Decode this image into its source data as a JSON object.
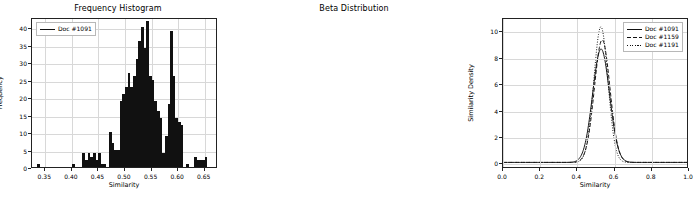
{
  "figure": {
    "width": 472,
    "height": 199,
    "background": "#ffffff",
    "ink_color": "#111111",
    "grid_color": "#d8d8d8"
  },
  "panels": [
    {
      "id": "frequency-histogram",
      "title": "Frequency Histogram",
      "xlabel": "Similarity",
      "ylabel": "Frequency",
      "legend": [
        {
          "label": "Doc #1091",
          "style": "solid"
        }
      ]
    },
    {
      "id": "beta-distribution",
      "title": "Beta Distribution",
      "xlabel": "Similarity",
      "ylabel": "Similarity Density",
      "legend": [
        {
          "label": "Doc #1091",
          "style": "solid"
        },
        {
          "label": "Doc #1159",
          "style": "dashed"
        },
        {
          "label": "Doc #1191",
          "style": "dotted"
        }
      ]
    }
  ],
  "chart_data": [
    {
      "type": "bar",
      "title": "Frequency Histogram",
      "xlabel": "Similarity",
      "ylabel": "Frequency",
      "legend": [
        "Doc #1091"
      ],
      "legend_position": "upper left",
      "grid": true,
      "xlim": [
        0.325,
        0.675
      ],
      "ylim": [
        0,
        43
      ],
      "xticks": [
        0.35,
        0.4,
        0.45,
        0.5,
        0.55,
        0.6,
        0.65
      ],
      "xticklabels": [
        "0.35",
        "0.40",
        "0.45",
        "0.50",
        "0.55",
        "0.60",
        "0.65"
      ],
      "yticks": [
        0,
        5,
        10,
        15,
        20,
        25,
        30,
        35,
        40
      ],
      "yticklabels": [
        "0",
        "5",
        "10",
        "15",
        "20",
        "25",
        "30",
        "35",
        "40"
      ],
      "bin_width": 0.005,
      "bin_left_edges": [
        0.335,
        0.34,
        0.345,
        0.35,
        0.355,
        0.36,
        0.365,
        0.37,
        0.375,
        0.38,
        0.385,
        0.39,
        0.395,
        0.4,
        0.405,
        0.41,
        0.415,
        0.42,
        0.425,
        0.43,
        0.435,
        0.44,
        0.445,
        0.45,
        0.455,
        0.46,
        0.465,
        0.47,
        0.475,
        0.48,
        0.485,
        0.49,
        0.495,
        0.5,
        0.505,
        0.51,
        0.515,
        0.52,
        0.525,
        0.53,
        0.535,
        0.54,
        0.545,
        0.55,
        0.555,
        0.56,
        0.565,
        0.57,
        0.575,
        0.58,
        0.585,
        0.59,
        0.595,
        0.6,
        0.605,
        0.61,
        0.615,
        0.62,
        0.625,
        0.63,
        0.635,
        0.64,
        0.645,
        0.65,
        0.655,
        0.66,
        0.665
      ],
      "values": [
        1,
        0,
        0,
        0,
        0,
        0,
        0,
        0,
        0,
        0,
        0,
        0,
        0,
        1,
        0,
        0,
        0,
        4,
        2,
        4,
        3,
        4,
        2,
        4,
        1,
        1,
        0,
        10,
        7,
        5,
        5,
        19,
        21,
        23,
        27,
        23,
        26,
        31,
        36,
        40,
        34,
        42,
        26,
        25,
        19,
        16,
        14,
        4,
        9,
        18,
        39,
        26,
        14,
        13,
        12,
        0,
        1,
        0,
        0,
        3,
        2,
        2,
        2,
        3,
        0,
        0,
        0
      ]
    },
    {
      "type": "line",
      "title": "Beta Distribution",
      "xlabel": "Similarity",
      "ylabel": "Similarity Density",
      "legend_position": "upper right",
      "grid": true,
      "xlim": [
        0.0,
        1.0
      ],
      "ylim": [
        -0.35,
        11.0
      ],
      "xticks": [
        0.0,
        0.2,
        0.4,
        0.6,
        0.8,
        1.0
      ],
      "xticklabels": [
        "0.0",
        "0.2",
        "0.4",
        "0.6",
        "0.8",
        "1.0"
      ],
      "yticks": [
        0,
        2,
        4,
        6,
        8,
        10
      ],
      "yticklabels": [
        "0",
        "2",
        "4",
        "6",
        "8",
        "10"
      ],
      "series": [
        {
          "name": "Doc #1091",
          "style": "solid",
          "peak_x": 0.535,
          "peak_y": 8.7,
          "mean": 0.533,
          "sd": 0.0458,
          "x": [
            0.0,
            0.05,
            0.1,
            0.15,
            0.2,
            0.25,
            0.3,
            0.33,
            0.36,
            0.38,
            0.4,
            0.42,
            0.44,
            0.46,
            0.48,
            0.5,
            0.51,
            0.52,
            0.53,
            0.535,
            0.54,
            0.55,
            0.56,
            0.57,
            0.58,
            0.6,
            0.62,
            0.64,
            0.66,
            0.68,
            0.7,
            0.75,
            0.8,
            0.85,
            0.9,
            0.95,
            1.0
          ],
          "y": [
            0.0,
            0.0,
            0.0,
            0.0,
            0.0,
            0.0,
            0.01,
            0.04,
            0.15,
            0.32,
            0.62,
            1.13,
            1.95,
            3.08,
            4.68,
            6.65,
            7.5,
            8.2,
            8.62,
            8.7,
            8.62,
            8.1,
            7.15,
            5.9,
            4.55,
            2.2,
            0.88,
            0.3,
            0.09,
            0.02,
            0.01,
            0.0,
            0.0,
            0.0,
            0.0,
            0.0,
            0.0
          ]
        },
        {
          "name": "Doc #1159",
          "style": "dashed",
          "peak_x": 0.54,
          "peak_y": 9.4,
          "mean": 0.539,
          "sd": 0.0424,
          "x": [
            0.0,
            0.05,
            0.1,
            0.15,
            0.2,
            0.25,
            0.3,
            0.33,
            0.36,
            0.38,
            0.4,
            0.42,
            0.44,
            0.46,
            0.48,
            0.5,
            0.51,
            0.52,
            0.53,
            0.54,
            0.545,
            0.55,
            0.56,
            0.57,
            0.58,
            0.6,
            0.62,
            0.64,
            0.66,
            0.68,
            0.7,
            0.75,
            0.8,
            0.85,
            0.9,
            0.95,
            1.0
          ],
          "y": [
            0.0,
            0.0,
            0.0,
            0.0,
            0.0,
            0.0,
            0.0,
            0.02,
            0.09,
            0.21,
            0.44,
            0.86,
            1.58,
            2.68,
            4.25,
            6.25,
            7.25,
            8.15,
            8.9,
            9.35,
            9.4,
            9.3,
            8.7,
            7.55,
            6.0,
            3.05,
            1.22,
            0.4,
            0.11,
            0.03,
            0.01,
            0.0,
            0.0,
            0.0,
            0.0,
            0.0,
            0.0
          ]
        },
        {
          "name": "Doc #1191",
          "style": "dotted",
          "peak_x": 0.533,
          "peak_y": 10.4,
          "mean": 0.532,
          "sd": 0.0383,
          "x": [
            0.0,
            0.05,
            0.1,
            0.15,
            0.2,
            0.25,
            0.3,
            0.33,
            0.36,
            0.38,
            0.4,
            0.42,
            0.44,
            0.46,
            0.48,
            0.5,
            0.51,
            0.52,
            0.53,
            0.533,
            0.54,
            0.55,
            0.56,
            0.57,
            0.58,
            0.6,
            0.62,
            0.64,
            0.66,
            0.68,
            0.7,
            0.75,
            0.8,
            0.85,
            0.9,
            0.95,
            1.0
          ],
          "y": [
            0.0,
            0.0,
            0.0,
            0.0,
            0.0,
            0.0,
            0.0,
            0.01,
            0.06,
            0.16,
            0.36,
            0.76,
            1.5,
            2.72,
            4.5,
            7.0,
            8.35,
            9.5,
            10.3,
            10.4,
            10.3,
            9.6,
            8.3,
            6.55,
            4.7,
            1.85,
            0.55,
            0.13,
            0.03,
            0.01,
            0.0,
            0.0,
            0.0,
            0.0,
            0.0,
            0.0,
            0.0
          ]
        }
      ]
    }
  ]
}
